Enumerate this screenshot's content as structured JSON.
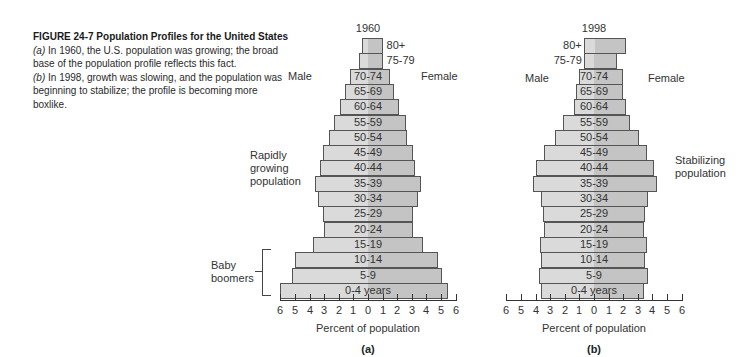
{
  "caption": {
    "title": "FIGURE 24-7  Population Profiles for the United States",
    "a_tag": "(a)",
    "a_text": " In 1960, the U.S. population was growing; the broad base of the population profile reflects this fact.",
    "b_tag": "(b)",
    "b_text": " In 1998, growth was slowing, and the population was beginning to stabilize; the profile is becoming more boxlike."
  },
  "colors": {
    "male": "#dadada",
    "female": "#c4c4c4",
    "border": "#555555"
  },
  "chart_data": [
    {
      "type": "bar",
      "orientation": "horizontal-population-pyramid",
      "title": "1960",
      "panel_label": "(a)",
      "xlabel": "Percent of population",
      "ylabel": "",
      "xlim": [
        -6,
        6
      ],
      "xticks": [
        "6",
        "5",
        "4",
        "3",
        "2",
        "1",
        "0",
        "1",
        "2",
        "3",
        "4",
        "5",
        "6"
      ],
      "left_label": "Male",
      "right_label": "Female",
      "annotations": [
        "Rapidly growing population",
        "Baby boomers"
      ],
      "categories": [
        "80+",
        "75-79",
        "70-74",
        "65-69",
        "60-64",
        "55-59",
        "50-54",
        "45-49",
        "40-44",
        "35-39",
        "30-34",
        "25-29",
        "20-24",
        "15-19",
        "10-14",
        "5-9",
        "0-4 years"
      ],
      "series": [
        {
          "name": "Male",
          "values": [
            0.4,
            0.6,
            1.2,
            1.6,
            1.9,
            2.3,
            2.7,
            3.1,
            3.3,
            3.6,
            3.4,
            3.1,
            3.0,
            3.8,
            5.0,
            5.2,
            6.0
          ]
        },
        {
          "name": "Female",
          "values": [
            1.0,
            1.0,
            1.5,
            1.8,
            2.1,
            2.6,
            2.7,
            3.1,
            3.2,
            3.6,
            3.4,
            3.1,
            3.1,
            3.8,
            4.8,
            5.1,
            5.5
          ]
        }
      ],
      "grid": false
    },
    {
      "type": "bar",
      "orientation": "horizontal-population-pyramid",
      "title": "1998",
      "panel_label": "(b)",
      "xlabel": "Percent of population",
      "ylabel": "",
      "xlim": [
        -6,
        6
      ],
      "xticks": [
        "6",
        "5",
        "4",
        "3",
        "2",
        "1",
        "0",
        "1",
        "2",
        "3",
        "4",
        "5",
        "6"
      ],
      "left_label": "Male",
      "right_label": "Female",
      "annotations": [
        "Stabilizing population"
      ],
      "categories": [
        "80+",
        "75-79",
        "70-74",
        "65-69",
        "60-64",
        "55-59",
        "50-54",
        "45-49",
        "40-44",
        "35-39",
        "30-34",
        "25-29",
        "20-24",
        "15-19",
        "10-14",
        "5-9",
        "0-4 years"
      ],
      "series": [
        {
          "name": "Male",
          "values": [
            0.7,
            0.7,
            1.0,
            1.2,
            1.4,
            2.1,
            2.7,
            3.4,
            4.0,
            4.2,
            3.6,
            3.5,
            3.4,
            3.7,
            3.6,
            3.8,
            3.6
          ]
        },
        {
          "name": "Female",
          "values": [
            2.2,
            1.6,
            2.0,
            2.0,
            2.2,
            2.5,
            3.1,
            3.6,
            4.1,
            4.3,
            3.7,
            3.5,
            3.4,
            3.6,
            3.5,
            3.7,
            3.4
          ]
        }
      ],
      "grid": false
    }
  ],
  "labels": {
    "a": {
      "year": "1960",
      "male": "Male",
      "female": "Female",
      "annot_growing": [
        "Rapidly",
        "growing",
        "population"
      ],
      "annot_boomers": [
        "Baby",
        "boomers"
      ],
      "xlabel": "Percent of population",
      "panel": "(a)"
    },
    "b": {
      "year": "1998",
      "male": "Male",
      "female": "Female",
      "annot_stable": [
        "Stabilizing",
        "population"
      ],
      "xlabel": "Percent of population",
      "panel": "(b)"
    }
  }
}
